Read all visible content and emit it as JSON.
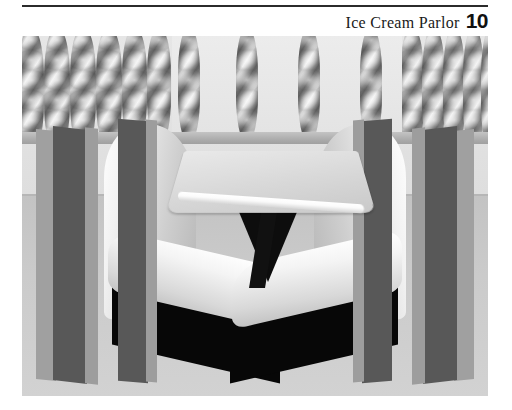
{
  "page": {
    "chapter_title": "Ice Cream Parlor",
    "page_number": "10",
    "background_color": "#ffffff",
    "rule_color": "#2b2b2b"
  },
  "figure": {
    "caption": "",
    "alt_description": "3D rendered interior of an ice cream parlor booth: a square pedestal table flanked by two white upholstered booth seats with dark plinths, dark divider posts, and a decorative screen of twisted barley-twist spindles along the upper wall.",
    "scene": {
      "name": "ice-cream-parlor-booth",
      "elements": [
        "twisted-spindle-screen",
        "back-wall",
        "floor",
        "left-booth-seat",
        "right-booth-seat",
        "pedestal-table",
        "divider-posts"
      ]
    },
    "colors": {
      "wall": "#dcdcdc",
      "floor": "#c9c9c9",
      "seat_cushion": "#f2f2f2",
      "seat_highlight": "#ffffff",
      "plinth_dark": "#070707",
      "post_dark": "#585858",
      "post_edge": "#9d9d9d",
      "table_top": "#dedede",
      "table_edge_highlight": "#ffffff",
      "spindle_mid": "#8e8e8e"
    }
  }
}
